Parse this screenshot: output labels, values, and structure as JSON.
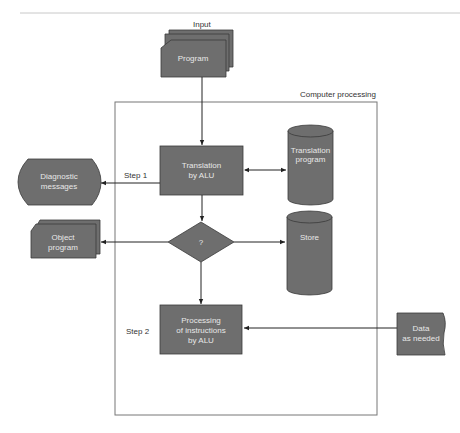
{
  "diagram": {
    "type": "flowchart",
    "colors": {
      "shape_fill": "#6e6e6e",
      "shape_stroke": "#3a3a3a",
      "line": "#222222",
      "frame": "#777777",
      "top_rule": "#c8c8c8"
    },
    "labels": {
      "input": "Input",
      "container": "Computer processing",
      "step1": "Step 1",
      "step2": "Step 2"
    },
    "nodes": {
      "program": {
        "line1": "Program"
      },
      "translation_alu": {
        "line1": "Translation",
        "line2": "by ALU"
      },
      "translation_program": {
        "line1": "Translation",
        "line2": "program"
      },
      "diagnostic": {
        "line1": "Diagnostic",
        "line2": "messages"
      },
      "decision": {
        "line1": "?"
      },
      "store": {
        "line1": "Store"
      },
      "object_program": {
        "line1": "Object",
        "line2": "program"
      },
      "processing": {
        "line1": "Processing",
        "line2": "of instructions",
        "line3": "by ALU"
      },
      "data": {
        "line1": "Data",
        "line2": "as needed"
      }
    },
    "edges": [
      {
        "from": "program",
        "to": "translation_alu"
      },
      {
        "from": "translation_alu",
        "to": "translation_program",
        "bidirectional": true
      },
      {
        "from": "translation_alu",
        "to": "diagnostic",
        "label": "Step 1"
      },
      {
        "from": "translation_alu",
        "to": "decision"
      },
      {
        "from": "decision",
        "to": "object_program"
      },
      {
        "from": "decision",
        "to": "store"
      },
      {
        "from": "decision",
        "to": "processing"
      },
      {
        "from": "data",
        "to": "processing"
      }
    ]
  }
}
